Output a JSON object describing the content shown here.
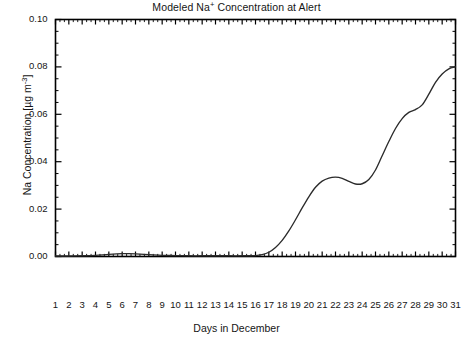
{
  "figure": {
    "title_pre": "Modeled Na",
    "title_sup": "+",
    "title_post": " Concentration at Alert",
    "title_full": "Modeled Na+ Concentration at Alert",
    "line_color": "#2b2b2b",
    "axis_color": "#000000",
    "background": "#ffffff"
  },
  "chart_data": {
    "type": "line",
    "title": "Modeled Na+ Concentration at Alert",
    "xlabel": "Days in December",
    "ylabel_pre": "Na Concentration [",
    "ylabel_mu": "µg m",
    "ylabel_sup": "-3",
    "ylabel_post": "]",
    "ylabel": "Na Concentration [µg m-3]",
    "grid": false,
    "legend": false,
    "xlim": [
      1,
      31
    ],
    "ylim": [
      0.0,
      0.1
    ],
    "yticks": [
      0.0,
      0.02,
      0.04,
      0.06,
      0.08,
      0.1
    ],
    "ytick_labels": [
      "0.00",
      "0.02",
      "0.04",
      "0.06",
      "0.08",
      "0.10"
    ],
    "xticks": [
      1,
      2,
      3,
      4,
      5,
      6,
      7,
      8,
      9,
      10,
      11,
      12,
      13,
      14,
      15,
      16,
      17,
      18,
      19,
      20,
      21,
      22,
      23,
      24,
      25,
      26,
      27,
      28,
      29,
      30,
      31
    ],
    "xtick_labels": [
      "1",
      "2",
      "3",
      "4",
      "5",
      "6",
      "7",
      "8",
      "9",
      "10",
      "11",
      "12",
      "13",
      "14",
      "15",
      "16",
      "17",
      "18",
      "19",
      "20",
      "21",
      "22",
      "23",
      "24",
      "25",
      "26",
      "27",
      "28",
      "29",
      "30",
      "31"
    ],
    "x_minor_ticks_per_interval": 2,
    "series": [
      {
        "name": "Modeled Na concentration",
        "x": [
          1,
          2,
          3,
          4,
          5,
          6,
          6.5,
          7,
          8,
          9,
          10,
          11,
          12,
          13,
          14,
          15,
          16,
          16.5,
          17,
          17.5,
          18,
          18.5,
          19,
          19.5,
          20,
          20.5,
          21,
          21.5,
          22,
          22.5,
          23,
          23.5,
          24,
          24.5,
          25,
          25.5,
          26,
          26.5,
          27,
          27.5,
          28,
          28.5,
          29,
          29.5,
          30,
          30.5,
          31
        ],
        "values": [
          0.0002,
          0.0002,
          0.0003,
          0.0005,
          0.0009,
          0.0012,
          0.0012,
          0.0011,
          0.0008,
          0.0005,
          0.0004,
          0.0003,
          0.0003,
          0.0003,
          0.0003,
          0.0003,
          0.0004,
          0.0008,
          0.0018,
          0.0038,
          0.0068,
          0.0108,
          0.0155,
          0.0205,
          0.0252,
          0.0292,
          0.0318,
          0.0331,
          0.0335,
          0.033,
          0.0317,
          0.0306,
          0.0307,
          0.0325,
          0.0365,
          0.0425,
          0.0485,
          0.054,
          0.0582,
          0.0608,
          0.062,
          0.064,
          0.0685,
          0.0735,
          0.077,
          0.0792,
          0.08
        ]
      }
    ],
    "notable_points": {
      "early_bump_day": 6,
      "early_bump_value": 0.0012,
      "rise_onset_day": 17,
      "first_plateau_day": 22,
      "first_plateau_value": 0.0335,
      "local_dip_day": 23.5,
      "local_dip_value": 0.0306,
      "shoulder_day": 28,
      "shoulder_value": 0.062,
      "final_day": 31,
      "final_value": 0.08
    }
  }
}
